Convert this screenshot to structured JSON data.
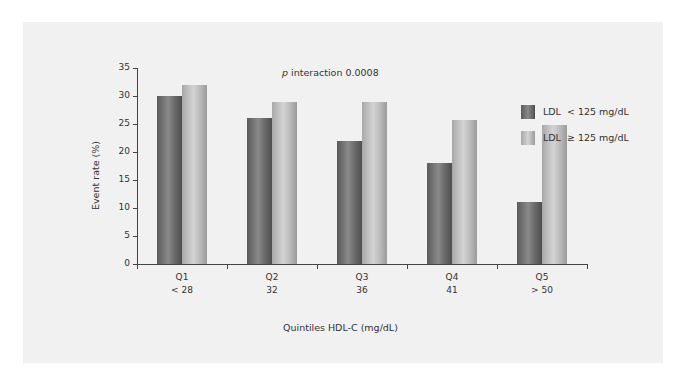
{
  "chart_data": {
    "type": "bar",
    "title": "",
    "xlabel": "Quintiles HDL-C (mg/dL)",
    "ylabel": "Event rate (%)",
    "ylim": [
      0,
      35
    ],
    "yticks": [
      0,
      5,
      10,
      15,
      20,
      25,
      30,
      35
    ],
    "grid": false,
    "legend_position": "right",
    "categories": [
      "Q1 < 28",
      "Q2 32",
      "Q3 36",
      "Q4 41",
      "Q5 > 50"
    ],
    "category_labels": [
      {
        "quintile": "Q1",
        "value": "< 28"
      },
      {
        "quintile": "Q2",
        "value": "32"
      },
      {
        "quintile": "Q3",
        "value": "36"
      },
      {
        "quintile": "Q4",
        "value": "41"
      },
      {
        "quintile": "Q5",
        "value": "> 50"
      }
    ],
    "series": [
      {
        "name": "LDL < 125 mg/dL",
        "color": "#707070",
        "values": [
          30,
          26,
          22,
          18,
          11
        ]
      },
      {
        "name": "LDL ≥ 125 mg/dL",
        "color": "#bcbcbc",
        "values": [
          32,
          29,
          29,
          25.8,
          24.8
        ]
      }
    ],
    "annotations": [
      {
        "text_italic": "p",
        "text": " interaction 0.0008"
      }
    ]
  },
  "legend": {
    "items": [
      {
        "label_prefix": "LDL",
        "label_rest": "< 125 mg/dL"
      },
      {
        "label_prefix": "LDL",
        "label_rest": "≥ 125 mg/dL"
      }
    ]
  }
}
